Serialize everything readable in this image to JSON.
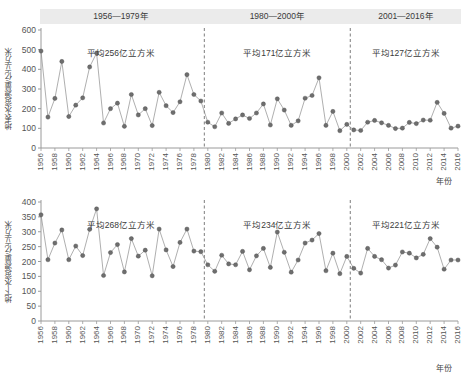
{
  "periods": [
    {
      "label": "1956—1979年",
      "start_year": 1956,
      "end_year": 1979
    },
    {
      "label": "1980—2000年",
      "start_year": 1980,
      "end_year": 2000
    },
    {
      "label": "2001—2016年",
      "start_year": 2001,
      "end_year": 2016
    }
  ],
  "xaxis_title": "年份",
  "chart_data": [
    {
      "type": "line",
      "id": "surface-water",
      "title": "",
      "ylabel": "地表水资源量/亿立方米",
      "xlabel": "年份",
      "ylim": [
        0,
        600
      ],
      "yticks": [
        0,
        100,
        200,
        300,
        400,
        500,
        600
      ],
      "xlim": [
        1956,
        2016
      ],
      "xticks": [
        1956,
        1958,
        1960,
        1962,
        1964,
        1966,
        1968,
        1970,
        1972,
        1974,
        1976,
        1978,
        1980,
        1982,
        1984,
        1986,
        1988,
        1990,
        1992,
        1994,
        1996,
        1998,
        2000,
        2002,
        2004,
        2006,
        2008,
        2010,
        2012,
        2014,
        2016
      ],
      "grid": false,
      "legend": "none",
      "annotations": [
        {
          "text": "平均256亿立方米",
          "period": "1956—1979年",
          "value": 256
        },
        {
          "text": "平均171亿立方米",
          "period": "1980—2000年",
          "value": 171
        },
        {
          "text": "平均127亿立方米",
          "period": "2001—2016年",
          "value": 127
        }
      ],
      "dividers": [
        1979.5,
        2000.5
      ],
      "x": [
        1956,
        1957,
        1958,
        1959,
        1960,
        1961,
        1962,
        1963,
        1964,
        1965,
        1966,
        1967,
        1968,
        1969,
        1970,
        1971,
        1972,
        1973,
        1974,
        1975,
        1976,
        1977,
        1978,
        1979,
        1980,
        1981,
        1982,
        1983,
        1984,
        1985,
        1986,
        1987,
        1988,
        1989,
        1990,
        1991,
        1992,
        1993,
        1994,
        1995,
        1996,
        1997,
        1998,
        1999,
        2000,
        2001,
        2002,
        2003,
        2004,
        2005,
        2006,
        2007,
        2008,
        2009,
        2010,
        2011,
        2012,
        2013,
        2014,
        2015,
        2016
      ],
      "values": [
        493,
        157,
        252,
        440,
        160,
        218,
        255,
        412,
        483,
        127,
        200,
        228,
        110,
        272,
        168,
        200,
        114,
        283,
        215,
        180,
        235,
        373,
        272,
        239,
        131,
        108,
        178,
        125,
        148,
        168,
        150,
        178,
        224,
        117,
        250,
        193,
        115,
        138,
        253,
        267,
        357,
        115,
        186,
        88,
        120,
        92,
        89,
        131,
        140,
        128,
        115,
        99,
        101,
        130,
        124,
        142,
        141,
        232,
        176,
        101,
        111
      ]
    },
    {
      "type": "line",
      "id": "groundwater",
      "title": "",
      "ylabel": "地下水资源量/亿立方米",
      "xlabel": "年份",
      "ylim": [
        0,
        400
      ],
      "yticks": [
        0,
        50,
        100,
        150,
        200,
        250,
        300,
        350,
        400
      ],
      "xlim": [
        1956,
        2016
      ],
      "xticks": [
        1956,
        1958,
        1960,
        1962,
        1964,
        1966,
        1968,
        1970,
        1972,
        1974,
        1976,
        1978,
        1980,
        1982,
        1984,
        1986,
        1988,
        1990,
        1992,
        1994,
        1996,
        1998,
        2000,
        2002,
        2004,
        2006,
        2008,
        2010,
        2012,
        2014,
        2016
      ],
      "grid": false,
      "legend": "none",
      "annotations": [
        {
          "text": "平均268亿立方米",
          "period": "1956—1979年",
          "value": 268
        },
        {
          "text": "平均234亿立方米",
          "period": "1980—2000年",
          "value": 234
        },
        {
          "text": "平均221亿立方米",
          "period": "2001—2016年",
          "value": 221
        }
      ],
      "dividers": [
        1979.5,
        2000.5
      ],
      "x": [
        1956,
        1957,
        1958,
        1959,
        1960,
        1961,
        1962,
        1963,
        1964,
        1965,
        1966,
        1967,
        1968,
        1969,
        1970,
        1971,
        1972,
        1973,
        1974,
        1975,
        1976,
        1977,
        1978,
        1979,
        1980,
        1981,
        1982,
        1983,
        1984,
        1985,
        1986,
        1987,
        1988,
        1989,
        1990,
        1991,
        1992,
        1993,
        1994,
        1995,
        1996,
        1997,
        1998,
        1999,
        2000,
        2001,
        2002,
        2003,
        2004,
        2005,
        2006,
        2007,
        2008,
        2009,
        2010,
        2011,
        2012,
        2013,
        2014,
        2015,
        2016
      ],
      "values": [
        357,
        206,
        262,
        306,
        206,
        252,
        220,
        308,
        377,
        153,
        230,
        257,
        165,
        277,
        218,
        238,
        152,
        309,
        239,
        183,
        264,
        309,
        235,
        233,
        189,
        167,
        221,
        192,
        189,
        234,
        172,
        219,
        244,
        180,
        299,
        231,
        164,
        205,
        262,
        272,
        294,
        169,
        228,
        159,
        217,
        177,
        161,
        244,
        217,
        206,
        178,
        188,
        232,
        228,
        212,
        224,
        277,
        248,
        174,
        205,
        205
      ]
    }
  ]
}
